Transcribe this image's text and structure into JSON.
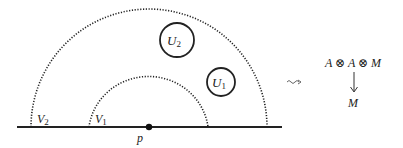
{
  "diagram": {
    "regions": {
      "outer_arc": {
        "label": "V",
        "sub": "2"
      },
      "inner_arc": {
        "label": "V",
        "sub": "1"
      },
      "circle_large": {
        "label": "U",
        "sub": "2"
      },
      "circle_small": {
        "label": "U",
        "sub": "1"
      }
    },
    "point": {
      "label": "p"
    },
    "squiggle_arrow": "⇝",
    "algebra": {
      "top": "A ⊗ A ⊗ M",
      "bottom": "M"
    }
  }
}
